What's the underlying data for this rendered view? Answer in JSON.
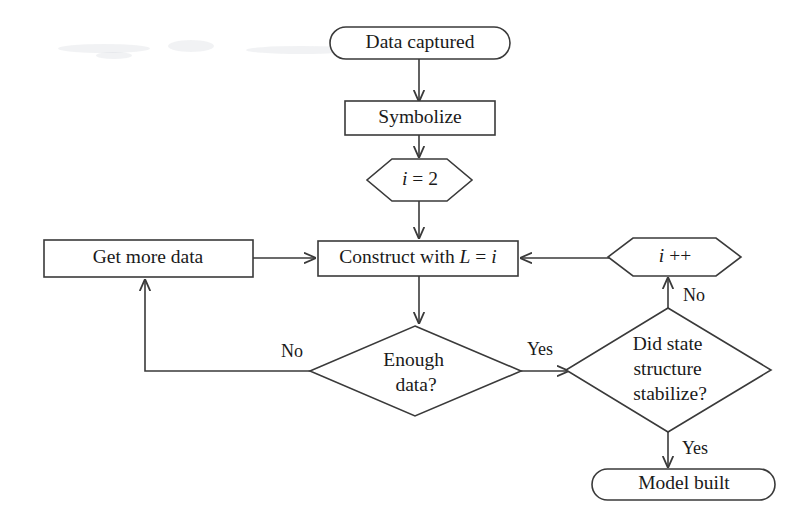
{
  "diagram": {
    "background_color": "#ffffff",
    "stroke_color": "#3a3a3a",
    "text_color": "#1a1a1a",
    "nodes": {
      "start": {
        "label": "Data captured",
        "shape": "terminator"
      },
      "symbolize": {
        "label": "Symbolize",
        "shape": "process"
      },
      "init": {
        "label_prefix": "i",
        "label_suffix": " = 2",
        "label": "i = 2",
        "shape": "hexagon"
      },
      "get_more_data": {
        "label": "Get more data",
        "shape": "process"
      },
      "construct": {
        "label": "Construct with L = i",
        "text_plain": "Construct with ",
        "var_l": "L",
        "eq": " = ",
        "var_i": "i",
        "shape": "process"
      },
      "increment": {
        "label": "i ++",
        "var_i": "i",
        "op": " ++",
        "shape": "hexagon"
      },
      "enough_data": {
        "line1": "Enough",
        "line2": "data?",
        "label": "Enough data?",
        "shape": "decision"
      },
      "stabilize": {
        "line1": "Did state",
        "line2": "structure",
        "line3": "stabilize?",
        "label": "Did state structure stabilize?",
        "shape": "decision"
      },
      "end": {
        "label": "Model built",
        "shape": "terminator"
      }
    },
    "edge_labels": {
      "enough_no": "No",
      "enough_yes": "Yes",
      "stabilize_no": "No",
      "stabilize_yes": "Yes"
    }
  }
}
